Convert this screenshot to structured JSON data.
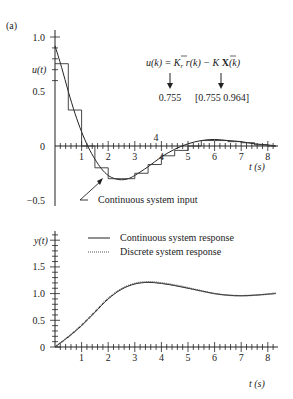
{
  "figure": {
    "panel_label": "(a)"
  },
  "chart_data": [
    {
      "type": "line",
      "title": "",
      "xlabel": "t (s)",
      "ylabel": "u(t)",
      "xlim": [
        0,
        8.3
      ],
      "ylim": [
        -0.5,
        1.0
      ],
      "x_ticks": [
        1,
        2,
        3,
        4,
        5,
        6,
        7,
        8
      ],
      "x_tick_labels": [
        "1",
        "2",
        "3",
        "4",
        "5",
        "6",
        "7",
        "8"
      ],
      "y_ticks": [
        -0.5,
        0,
        0.5,
        1.0
      ],
      "y_tick_labels": [
        "−0.5",
        "0",
        "0.5",
        "1.0"
      ],
      "grid": false,
      "annotations": {
        "equation": "u(k) = K̄r r(k) − K̄ X(k)",
        "kr_value": "0.755",
        "k_value": "[0.755  0.964]",
        "input_label": "Continuous system input",
        "top_tick_label": "4"
      },
      "series": [
        {
          "name": "Continuous system input",
          "style": "solid",
          "x": [
            0,
            0.25,
            0.5,
            0.75,
            1.0,
            1.25,
            1.5,
            1.75,
            2.0,
            2.25,
            2.5,
            2.75,
            3.0,
            3.5,
            4.0,
            4.5,
            5.0,
            5.5,
            6.0,
            6.5,
            7.0,
            7.5,
            8.0,
            8.3
          ],
          "values": [
            0.92,
            0.72,
            0.5,
            0.3,
            0.13,
            -0.01,
            -0.12,
            -0.21,
            -0.27,
            -0.3,
            -0.31,
            -0.3,
            -0.27,
            -0.19,
            -0.1,
            -0.03,
            0.02,
            0.05,
            0.06,
            0.05,
            0.04,
            0.02,
            0.01,
            0.0
          ]
        },
        {
          "name": "Discrete (zero-order hold) input",
          "style": "step",
          "x": [
            0,
            0.5,
            1.0,
            1.5,
            2.0,
            2.5,
            3.0,
            3.5,
            4.0,
            4.5,
            5.0,
            5.5,
            6.0,
            6.5,
            7.0,
            7.5,
            8.0
          ],
          "values": [
            0.755,
            0.33,
            0.0,
            -0.2,
            -0.3,
            -0.3,
            -0.25,
            -0.17,
            -0.09,
            -0.04,
            0.0,
            0.05,
            0.05,
            0.04,
            0.03,
            0.01,
            0.0
          ]
        }
      ]
    },
    {
      "type": "line",
      "title": "",
      "xlabel": "t (s)",
      "ylabel": "y(t)",
      "xlim": [
        0,
        8.3
      ],
      "ylim": [
        0,
        2.0
      ],
      "x_ticks": [
        1,
        2,
        3,
        4,
        5,
        6,
        7,
        8
      ],
      "x_tick_labels": [
        "1",
        "2",
        "3",
        "4",
        "5",
        "6",
        "7",
        "8"
      ],
      "y_ticks": [
        0,
        0.5,
        1.0,
        1.5
      ],
      "y_tick_labels": [
        "0",
        "0.5",
        "1.0",
        "1.5"
      ],
      "grid": false,
      "legend": {
        "position": "top",
        "entries": [
          "Continuous system response",
          "Discrete system response"
        ]
      },
      "series": [
        {
          "name": "Continuous system response",
          "style": "solid",
          "x": [
            0,
            0.5,
            1.0,
            1.5,
            2.0,
            2.5,
            3.0,
            3.5,
            4.0,
            4.5,
            5.0,
            5.5,
            6.0,
            6.5,
            7.0,
            7.5,
            8.0,
            8.3
          ],
          "values": [
            0.0,
            0.19,
            0.4,
            0.65,
            0.9,
            1.08,
            1.18,
            1.21,
            1.19,
            1.15,
            1.1,
            1.05,
            1.0,
            0.97,
            0.96,
            0.97,
            0.99,
            1.0
          ]
        },
        {
          "name": "Discrete system response",
          "style": "dotted",
          "x": [
            0,
            0.5,
            1.0,
            1.5,
            2.0,
            2.5,
            3.0,
            3.5,
            4.0,
            4.5,
            5.0,
            5.5,
            6.0,
            6.5,
            7.0,
            7.5,
            8.0,
            8.3
          ],
          "values": [
            0.0,
            0.19,
            0.41,
            0.66,
            0.91,
            1.09,
            1.19,
            1.22,
            1.2,
            1.16,
            1.11,
            1.05,
            1.0,
            0.97,
            0.96,
            0.97,
            0.99,
            1.01
          ]
        }
      ]
    }
  ]
}
